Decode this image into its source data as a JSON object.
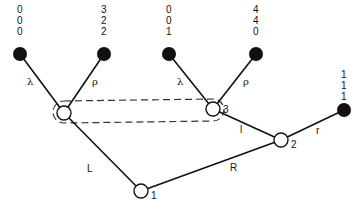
{
  "diagram": {
    "nodes": {
      "root": {
        "label": "1",
        "x": 141,
        "y": 191
      },
      "n2": {
        "label": "2",
        "x": 281,
        "y": 140
      },
      "n3": {
        "label": "3",
        "x": 213,
        "y": 109
      },
      "nA": {
        "label": "",
        "x": 64,
        "y": 113
      }
    },
    "leaves": [
      {
        "values": [
          "0",
          "0",
          "0"
        ],
        "x": 20,
        "y": 54
      },
      {
        "values": [
          "3",
          "2",
          "2"
        ],
        "x": 104,
        "y": 54
      },
      {
        "values": [
          "0",
          "0",
          "1"
        ],
        "x": 169,
        "y": 54
      },
      {
        "values": [
          "4",
          "4",
          "0"
        ],
        "x": 256,
        "y": 54
      },
      {
        "values": [
          "1",
          "1",
          "1"
        ],
        "x": 344,
        "y": 110
      }
    ],
    "edges": {
      "L": "L",
      "R": "R",
      "l": "l",
      "r": "r",
      "lambda1": "λ",
      "rho1": "ρ",
      "lambda2": "λ",
      "rho2": "ρ"
    }
  }
}
